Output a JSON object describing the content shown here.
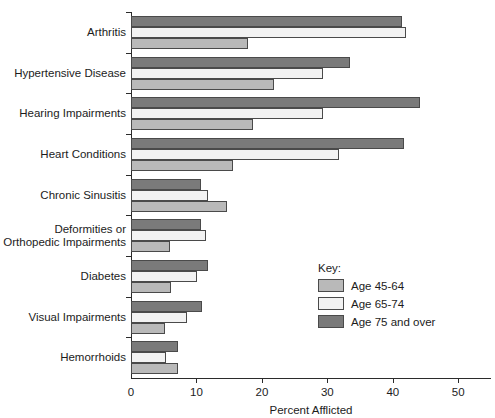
{
  "chart_data": {
    "type": "bar",
    "orientation": "horizontal",
    "title": "",
    "xlabel": "Percent Afflicted",
    "ylabel": "",
    "xlim": [
      0,
      55
    ],
    "xticks": [
      0,
      10,
      20,
      30,
      40,
      50
    ],
    "xtick_labels": [
      "0",
      "10",
      "20",
      "30",
      "40",
      "50"
    ],
    "grid": false,
    "legend_title": "Key:",
    "legend_position": "inside-lower-right",
    "categories": [
      "Arthritis",
      "Hypertensive Disease",
      "Hearing Impairments",
      "Heart Conditions",
      "Chronic Sinusitis",
      "Deformities or\nOrthopedic Impairments",
      "Diabetes",
      "Visual Impairments",
      "Hemorrhoids"
    ],
    "series": [
      {
        "name": "Age 45-64",
        "color": "#b9b9b9",
        "values": [
          17.8,
          21.8,
          18.7,
          15.6,
          14.7,
          6.0,
          6.1,
          5.2,
          7.2
        ]
      },
      {
        "name": "Age 65-74",
        "color": "#f2f2f2",
        "values": [
          42.0,
          29.4,
          29.4,
          31.8,
          11.8,
          11.5,
          10.1,
          8.6,
          5.4
        ]
      },
      {
        "name": "Age 75 and over",
        "color": "#7a7a7a",
        "values": [
          41.4,
          33.4,
          44.2,
          41.7,
          10.7,
          10.7,
          11.8,
          10.9,
          7.2
        ]
      }
    ]
  },
  "axis": {
    "x_title": "Percent Afflicted"
  },
  "legend": {
    "title": "Key:",
    "entries": [
      {
        "label": "Age 45-64",
        "swatch": "s0"
      },
      {
        "label": "Age 65-74",
        "swatch": "s1"
      },
      {
        "label": "Age 75 and over",
        "swatch": "s2"
      }
    ]
  }
}
